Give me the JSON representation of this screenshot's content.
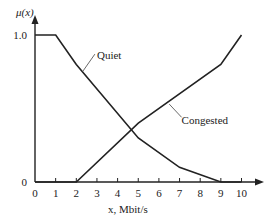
{
  "chart_data": {
    "type": "line",
    "title": "",
    "xlabel": "x, Mbit/s",
    "ylabel": "μ(x)",
    "xlim": [
      0,
      10
    ],
    "ylim": [
      0,
      1
    ],
    "x_ticks": [
      "0",
      "1",
      "2",
      "3",
      "4",
      "5",
      "6",
      "7",
      "8",
      "9",
      "10"
    ],
    "y_ticks": [
      "0",
      "1.0"
    ],
    "grid": false,
    "series": [
      {
        "name": "Quiet",
        "points": [
          [
            0,
            1
          ],
          [
            1,
            1
          ],
          [
            2,
            0.8
          ],
          [
            5,
            0.3
          ],
          [
            7,
            0.1
          ],
          [
            9,
            0
          ],
          [
            10,
            0
          ]
        ]
      },
      {
        "name": "Congested",
        "points": [
          [
            0,
            0
          ],
          [
            2,
            0
          ],
          [
            5,
            0.4
          ],
          [
            9,
            0.8
          ],
          [
            10,
            1
          ]
        ]
      }
    ],
    "annotations": [
      {
        "text": "Quiet",
        "series": "Quiet"
      },
      {
        "text": "Congested",
        "series": "Congested"
      }
    ]
  }
}
